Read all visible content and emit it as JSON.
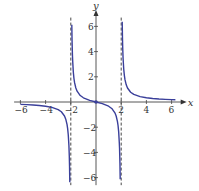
{
  "chart_data": {
    "type": "line",
    "title": "",
    "xlabel": "x",
    "ylabel": "y",
    "xlim": [
      -6.2,
      6.8
    ],
    "ylim": [
      -6.5,
      7
    ],
    "grid": false,
    "x_ticks": [
      -6,
      -4,
      -2,
      2,
      4,
      6
    ],
    "x_tick_labels": [
      "-6",
      "-4",
      "-2",
      "2",
      "4",
      "6"
    ],
    "y_ticks": [
      -6,
      -4,
      -2,
      2,
      4,
      6
    ],
    "y_tick_labels": [
      "-6",
      "-4",
      "-2",
      "2",
      "4",
      "6"
    ],
    "asymptotes": {
      "vertical": [
        -2,
        2
      ],
      "horizontal": [
        0
      ],
      "style": "dashed"
    },
    "series": [
      {
        "name": "left-branch",
        "color": "#3a3f9a",
        "x": [
          -6,
          -5.5,
          -5,
          -4.5,
          -4,
          -3.5,
          -3,
          -2.75,
          -2.5,
          -2.4,
          -2.3,
          -2.25,
          -2.2,
          -2.15,
          -2.12,
          -2.1,
          -2.08
        ],
        "y": [
          -0.188,
          -0.21,
          -0.238,
          -0.277,
          -0.333,
          -0.424,
          -0.6,
          -0.772,
          -1.111,
          -1.364,
          -1.775,
          -2.118,
          -2.619,
          -3.456,
          -4.286,
          -5.122,
          -6.37
        ]
      },
      {
        "name": "middle-branch",
        "color": "#3a3f9a",
        "x": [
          -1.92,
          -1.9,
          -1.87,
          -1.85,
          -1.8,
          -1.75,
          -1.7,
          -1.6,
          -1.5,
          -1.25,
          -1,
          -0.5,
          0,
          0.5,
          1,
          1.25,
          1.5,
          1.6,
          1.7,
          1.75,
          1.8,
          1.85,
          1.87,
          1.9,
          1.92
        ],
        "y": [
          6.122,
          4.872,
          3.716,
          3.245,
          2.368,
          1.867,
          1.532,
          1.111,
          0.857,
          0.513,
          0.333,
          0.133,
          0,
          -0.133,
          -0.333,
          -0.513,
          -0.857,
          -1.111,
          -1.532,
          -1.867,
          -2.368,
          -3.245,
          -3.716,
          -4.872,
          -6.122
        ]
      },
      {
        "name": "right-branch",
        "color": "#3a3f9a",
        "x": [
          2.08,
          2.1,
          2.12,
          2.15,
          2.2,
          2.25,
          2.3,
          2.4,
          2.5,
          2.75,
          3,
          3.5,
          4,
          4.5,
          5,
          5.5,
          6,
          6.3
        ],
        "y": [
          6.37,
          5.122,
          4.286,
          3.456,
          2.619,
          2.118,
          1.775,
          1.364,
          1.111,
          0.772,
          0.6,
          0.424,
          0.333,
          0.277,
          0.238,
          0.21,
          0.188,
          0.176
        ]
      }
    ],
    "points": [
      {
        "x": 0,
        "y": 0,
        "label": "origin"
      }
    ]
  }
}
